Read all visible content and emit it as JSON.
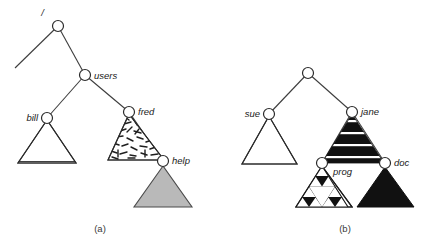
{
  "figure": {
    "captions": [
      {
        "id": "caption-a",
        "text": "(a)",
        "x": 100,
        "y": 232
      },
      {
        "id": "caption-b",
        "text": "(b)",
        "x": 345,
        "y": 232
      }
    ],
    "colors": {
      "stroke": "#2b2b2b",
      "edge": "#3d3d3d",
      "gray_fill": "#b9b9b9",
      "black_fill": "#111111",
      "white_fill": "#ffffff",
      "background": "#ffffff",
      "text": "#1a1a1a"
    },
    "diagrams": [
      {
        "id": "diagram-a",
        "caption": "(a)",
        "nodes": [
          {
            "name": "root",
            "label": "/",
            "cx": 58,
            "cy": 26,
            "r": 5.5,
            "label_x": 44,
            "label_y": 16,
            "anchor": "end"
          },
          {
            "name": "users",
            "label": "users",
            "cx": 85,
            "cy": 75,
            "r": 5.5,
            "label_x": 94,
            "label_y": 76,
            "anchor": "start"
          },
          {
            "name": "bill",
            "label": "bill",
            "cx": 47,
            "cy": 118,
            "r": 5.5,
            "label_x": 38,
            "label_y": 119,
            "anchor": "end"
          },
          {
            "name": "fred",
            "label": "fred",
            "cx": 129,
            "cy": 112,
            "r": 5.5,
            "label_x": 138,
            "label_y": 113,
            "anchor": "start"
          },
          {
            "name": "help",
            "label": "help",
            "cx": 163,
            "cy": 161,
            "r": 5.5,
            "label_x": 172,
            "label_y": 162,
            "anchor": "start"
          }
        ],
        "edges": [
          {
            "name": "edge-root-left-stub",
            "x1": 58,
            "y1": 26,
            "x2": 15,
            "y2": 68
          },
          {
            "name": "edge-root-users",
            "x1": 58,
            "y1": 26,
            "x2": 85,
            "y2": 75
          },
          {
            "name": "edge-users-bill",
            "x1": 85,
            "y1": 75,
            "x2": 47,
            "y2": 118
          },
          {
            "name": "edge-users-fred",
            "x1": 85,
            "y1": 75,
            "x2": 129,
            "y2": 112
          },
          {
            "name": "edge-fred-help",
            "x1": 129,
            "y1": 112,
            "x2": 163,
            "y2": 161
          }
        ],
        "subtrees": [
          {
            "name": "subtree-bill",
            "fill_style": "vertical-stripes",
            "apex_x": 47,
            "apex_y": 120,
            "left_x": 18,
            "right_x": 76,
            "base_y": 163
          },
          {
            "name": "subtree-fred",
            "fill_style": "scribble",
            "apex_x": 129,
            "apex_y": 114,
            "left_x": 108,
            "right_x": 164,
            "base_y": 160
          },
          {
            "name": "subtree-help",
            "fill_style": "solid-gray",
            "apex_x": 163,
            "apex_y": 166,
            "left_x": 134,
            "right_x": 192,
            "base_y": 207
          }
        ]
      },
      {
        "id": "diagram-b",
        "caption": "(b)",
        "nodes": [
          {
            "name": "root",
            "label": "",
            "cx": 308,
            "cy": 73,
            "r": 5.5,
            "label_x": 308,
            "label_y": 66,
            "anchor": "middle"
          },
          {
            "name": "sue",
            "label": "sue",
            "cx": 269,
            "cy": 114,
            "r": 5.5,
            "label_x": 260,
            "label_y": 115,
            "anchor": "end"
          },
          {
            "name": "jane",
            "label": "jane",
            "cx": 352,
            "cy": 112,
            "r": 5.5,
            "label_x": 361,
            "label_y": 113,
            "anchor": "start"
          },
          {
            "name": "prog",
            "label": "prog",
            "cx": 322,
            "cy": 163,
            "r": 5.5,
            "label_x": 333,
            "label_y": 173,
            "anchor": "start"
          },
          {
            "name": "doc",
            "label": "doc",
            "cx": 385,
            "cy": 163,
            "r": 5.5,
            "label_x": 394,
            "label_y": 164,
            "anchor": "start"
          }
        ],
        "edges": [
          {
            "name": "edge-root-sue",
            "x1": 308,
            "y1": 73,
            "x2": 269,
            "y2": 114
          },
          {
            "name": "edge-root-jane",
            "x1": 308,
            "y1": 73,
            "x2": 352,
            "y2": 112
          },
          {
            "name": "edge-jane-prog",
            "x1": 352,
            "y1": 112,
            "x2": 322,
            "y2": 163
          },
          {
            "name": "edge-jane-doc",
            "x1": 352,
            "y1": 112,
            "x2": 385,
            "y2": 163
          }
        ],
        "subtrees": [
          {
            "name": "subtree-sue",
            "fill_style": "horizontal-stripes",
            "apex_x": 269,
            "apex_y": 116,
            "left_x": 242,
            "right_x": 297,
            "base_y": 164
          },
          {
            "name": "subtree-jane",
            "fill_style": "black-horizontal-bands",
            "apex_x": 352,
            "apex_y": 114,
            "left_x": 322,
            "right_x": 384,
            "base_y": 163
          },
          {
            "name": "subtree-prog",
            "fill_style": "sierpinski",
            "apex_x": 322,
            "apex_y": 166,
            "left_x": 296,
            "right_x": 352,
            "base_y": 207
          },
          {
            "name": "subtree-doc",
            "fill_style": "solid-black",
            "apex_x": 385,
            "apex_y": 167,
            "left_x": 357,
            "right_x": 414,
            "base_y": 207
          }
        ]
      }
    ]
  }
}
